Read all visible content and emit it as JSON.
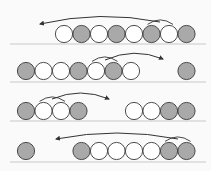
{
  "colors": {
    "background": "#fafafa",
    "filled": "#a9a9a9",
    "empty": "#ffffff",
    "stroke": "#3a3a3a",
    "baseline": "#c8c8c8",
    "arrow": "#333333"
  },
  "diagram": {
    "rows": [
      {
        "baseline_y": 44,
        "circle_cy": 34,
        "circles": [
          {
            "x": 64,
            "fill": "empty"
          },
          {
            "x": 81.5,
            "fill": "filled"
          },
          {
            "x": 99,
            "fill": "empty"
          },
          {
            "x": 116.5,
            "fill": "filled"
          },
          {
            "x": 134,
            "fill": "empty"
          },
          {
            "x": 151.5,
            "fill": "filled"
          },
          {
            "x": 169,
            "fill": "empty"
          },
          {
            "x": 186.5,
            "fill": "filled"
          }
        ],
        "bracket": {
          "x1": 151.5,
          "x2": 169
        },
        "arrow": {
          "from": [
            160,
            22
          ],
          "to": [
            40,
            24
          ],
          "direction": "left"
        }
      },
      {
        "baseline_y": 82,
        "circle_cy": 71,
        "circles": [
          {
            "x": 26,
            "fill": "filled"
          },
          {
            "x": 43.5,
            "fill": "empty"
          },
          {
            "x": 61,
            "fill": "empty"
          },
          {
            "x": 78.5,
            "fill": "filled"
          },
          {
            "x": 96,
            "fill": "empty"
          },
          {
            "x": 113.5,
            "fill": "filled"
          },
          {
            "x": 131,
            "fill": "empty"
          },
          {
            "x": 186.5,
            "fill": "filled"
          }
        ],
        "bracket": {
          "x1": 96,
          "x2": 113.5
        },
        "arrow": {
          "from": [
            105,
            60
          ],
          "to": [
            163,
            59
          ],
          "direction": "right"
        }
      },
      {
        "baseline_y": 121,
        "circle_cy": 111,
        "circles": [
          {
            "x": 26,
            "fill": "filled"
          },
          {
            "x": 43.5,
            "fill": "empty"
          },
          {
            "x": 61,
            "fill": "empty"
          },
          {
            "x": 78.5,
            "fill": "filled"
          },
          {
            "x": 134,
            "fill": "empty"
          },
          {
            "x": 151.5,
            "fill": "empty"
          },
          {
            "x": 169,
            "fill": "filled"
          },
          {
            "x": 186.5,
            "fill": "filled"
          }
        ],
        "bracket": {
          "x1": 43.5,
          "x2": 61
        },
        "arrow": {
          "from": [
            52,
            99
          ],
          "to": [
            109,
            99
          ],
          "direction": "right"
        }
      },
      {
        "baseline_y": 162,
        "circle_cy": 151,
        "circles": [
          {
            "x": 26,
            "fill": "filled"
          },
          {
            "x": 81.5,
            "fill": "filled"
          },
          {
            "x": 99,
            "fill": "empty"
          },
          {
            "x": 116.5,
            "fill": "empty"
          },
          {
            "x": 134,
            "fill": "empty"
          },
          {
            "x": 151.5,
            "fill": "empty"
          },
          {
            "x": 169,
            "fill": "filled"
          },
          {
            "x": 186.5,
            "fill": "filled"
          }
        ],
        "bracket": {
          "x1": 169,
          "x2": 186.5
        },
        "arrow": {
          "from": [
            178,
            139
          ],
          "to": [
            56,
            139
          ],
          "direction": "left"
        }
      }
    ]
  }
}
